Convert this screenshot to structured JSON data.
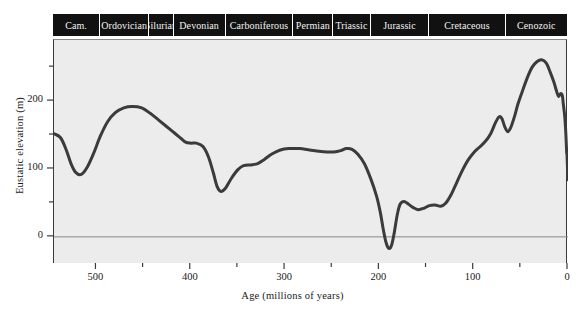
{
  "chart_data": {
    "type": "line",
    "title": "",
    "xlabel": "Age (millions of years)",
    "ylabel": "Eustatic elevation (m)",
    "xlim": [
      545,
      0
    ],
    "ylim": [
      -40,
      290
    ],
    "x_ticks": [
      500,
      400,
      300,
      200,
      100,
      0
    ],
    "x_ticks_minor": [
      450,
      350,
      250,
      150,
      50
    ],
    "y_ticks": [
      0,
      100,
      200
    ],
    "y_ticks_minor": [
      50,
      150,
      250
    ],
    "grid": false,
    "legend": null,
    "zero_line": 0,
    "series": [
      {
        "name": "Eustatic sea level",
        "color": "#3b3b3b",
        "points": [
          [
            545,
            152
          ],
          [
            538,
            146
          ],
          [
            532,
            128
          ],
          [
            527,
            108
          ],
          [
            522,
            95
          ],
          [
            516,
            92
          ],
          [
            510,
            102
          ],
          [
            503,
            123
          ],
          [
            496,
            148
          ],
          [
            488,
            170
          ],
          [
            480,
            183
          ],
          [
            471,
            190
          ],
          [
            462,
            192
          ],
          [
            452,
            190
          ],
          [
            443,
            182
          ],
          [
            434,
            172
          ],
          [
            426,
            163
          ],
          [
            419,
            155
          ],
          [
            412,
            147
          ],
          [
            406,
            140
          ],
          [
            400,
            138
          ],
          [
            394,
            138
          ],
          [
            387,
            133
          ],
          [
            381,
            117
          ],
          [
            376,
            94
          ],
          [
            372,
            74
          ],
          [
            368,
            67
          ],
          [
            363,
            72
          ],
          [
            357,
            86
          ],
          [
            350,
            99
          ],
          [
            344,
            105
          ],
          [
            336,
            106
          ],
          [
            329,
            108
          ],
          [
            322,
            114
          ],
          [
            314,
            122
          ],
          [
            305,
            128
          ],
          [
            296,
            130
          ],
          [
            285,
            130
          ],
          [
            274,
            128
          ],
          [
            264,
            126
          ],
          [
            255,
            125
          ],
          [
            248,
            125
          ],
          [
            241,
            127
          ],
          [
            235,
            130
          ],
          [
            229,
            129
          ],
          [
            223,
            122
          ],
          [
            216,
            108
          ],
          [
            209,
            85
          ],
          [
            203,
            60
          ],
          [
            199,
            36
          ],
          [
            196,
            12
          ],
          [
            193,
            -8
          ],
          [
            190,
            -17
          ],
          [
            187,
            -12
          ],
          [
            184,
            8
          ],
          [
            181,
            33
          ],
          [
            178,
            48
          ],
          [
            174,
            52
          ],
          [
            169,
            48
          ],
          [
            164,
            43
          ],
          [
            159,
            40
          ],
          [
            153,
            42
          ],
          [
            147,
            46
          ],
          [
            141,
            47
          ],
          [
            135,
            45
          ],
          [
            130,
            49
          ],
          [
            124,
            62
          ],
          [
            118,
            80
          ],
          [
            112,
            98
          ],
          [
            106,
            113
          ],
          [
            100,
            124
          ],
          [
            94,
            132
          ],
          [
            88,
            140
          ],
          [
            82,
            152
          ],
          [
            77,
            168
          ],
          [
            73,
            177
          ],
          [
            70,
            174
          ],
          [
            67,
            162
          ],
          [
            64,
            155
          ],
          [
            61,
            160
          ],
          [
            57,
            176
          ],
          [
            53,
            196
          ],
          [
            48,
            216
          ],
          [
            43,
            235
          ],
          [
            38,
            250
          ],
          [
            33,
            258
          ],
          [
            28,
            261
          ],
          [
            23,
            256
          ],
          [
            19,
            243
          ],
          [
            15,
            228
          ],
          [
            12,
            214
          ],
          [
            10,
            207
          ],
          [
            8,
            211
          ],
          [
            6,
            208
          ],
          [
            5,
            196
          ],
          [
            3.5,
            178
          ],
          [
            2.5,
            158
          ],
          [
            1.8,
            137
          ],
          [
            1.4,
            124
          ],
          [
            1.1,
            122
          ],
          [
            0.8,
            112
          ],
          [
            0.4,
            96
          ],
          [
            0,
            84
          ]
        ]
      }
    ],
    "periods": [
      {
        "label": "Cam.",
        "start": 545,
        "end": 495
      },
      {
        "label": "Ordovician",
        "start": 495,
        "end": 443
      },
      {
        "label": "Silurian",
        "start": 443,
        "end": 417
      },
      {
        "label": "Devonian",
        "start": 417,
        "end": 362
      },
      {
        "label": "Carboniferous",
        "start": 362,
        "end": 290
      },
      {
        "label": "Permian",
        "start": 290,
        "end": 248
      },
      {
        "label": "Triassic",
        "start": 248,
        "end": 208
      },
      {
        "label": "Jurassic",
        "start": 208,
        "end": 146
      },
      {
        "label": "Cretaceous",
        "start": 146,
        "end": 65
      },
      {
        "label": "Cenozoic",
        "start": 65,
        "end": 0
      }
    ]
  },
  "axes": {
    "x_tick_labels": [
      "500",
      "400",
      "300",
      "200",
      "100",
      "0"
    ],
    "y_tick_labels": [
      "0",
      "100",
      "200"
    ],
    "x_title": "Age (millions of years)",
    "y_title": "Eustatic elevation (m)"
  },
  "colors": {
    "curve": "#3b3b3b",
    "plot_background": "#ececec",
    "band_background": "#111111",
    "band_text": "#f2f2f2",
    "axis": "#3a3a3a",
    "zero_line": "#8a8a8a"
  }
}
